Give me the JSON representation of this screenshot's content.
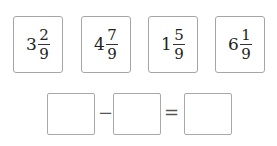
{
  "cards": [
    {
      "whole": "3",
      "numerator": "2",
      "denominator": "9"
    },
    {
      "whole": "4",
      "numerator": "7",
      "denominator": "9"
    },
    {
      "whole": "1",
      "numerator": "5",
      "denominator": "9"
    },
    {
      "whole": "6",
      "numerator": "1",
      "denominator": "9"
    }
  ],
  "equation": {
    "operator_minus": "−",
    "operator_equals": "=",
    "blank_1": "",
    "blank_2": "",
    "blank_3": ""
  }
}
